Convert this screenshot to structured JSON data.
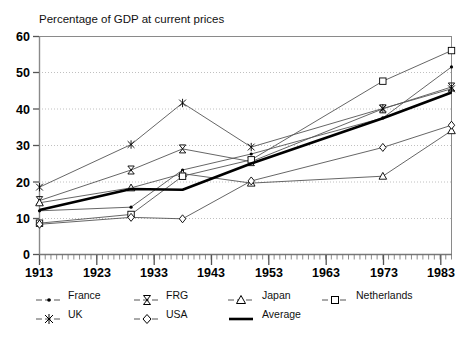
{
  "chart_data": {
    "type": "line",
    "title": "Percentage of GDP at current prices",
    "xlabel": "",
    "ylabel": "",
    "xlim": [
      1913,
      1985
    ],
    "ylim": [
      0,
      60
    ],
    "yticks": [
      0,
      10,
      20,
      30,
      40,
      50,
      60
    ],
    "xticks": [
      1913,
      1923,
      1933,
      1943,
      1953,
      1963,
      1973,
      1983
    ],
    "xtick_labels": [
      "1913",
      "1923",
      "1933",
      "1943",
      "1953",
      "1963",
      "1973",
      "1983"
    ],
    "ytick_labels": [
      "0",
      "10",
      "20",
      "30",
      "40",
      "50",
      "60"
    ],
    "minor_x_ticks": "every year",
    "grid": "horizontal dotted gridlines at y = 10, 20, 30, 40, 50",
    "legend_position": "below axes, two rows of four",
    "x": [
      1913,
      1929,
      1938,
      1950,
      1973,
      1985
    ],
    "series": [
      {
        "name": "France",
        "marker": "dot",
        "values": [
          12.0,
          13.0,
          23.2,
          27.6,
          37.5,
          51.5
        ]
      },
      {
        "name": "FRG",
        "marker": "bowtie",
        "values": [
          14.8,
          23.2,
          29.0,
          25.5,
          40.0,
          46.0
        ]
      },
      {
        "name": "Japan",
        "marker": "triangle",
        "values": [
          14.2,
          18.3,
          22.2,
          19.6,
          21.5,
          34.0
        ]
      },
      {
        "name": "Netherlands",
        "marker": "square",
        "values": [
          8.6,
          11.0,
          21.5,
          26.0,
          47.6,
          56.0
        ]
      },
      {
        "name": "UK",
        "marker": "cross",
        "values": [
          18.5,
          30.2,
          41.6,
          29.5,
          40.1,
          45.5
        ]
      },
      {
        "name": "USA",
        "marker": "diamond",
        "values": [
          8.3,
          10.2,
          9.8,
          20.2,
          29.4,
          35.5
        ]
      },
      {
        "name": "Average",
        "marker": "none",
        "values": [
          12.2,
          18.0,
          17.8,
          25.0,
          37.4,
          44.5
        ]
      }
    ]
  },
  "legend": {
    "entries": [
      {
        "label": "France",
        "marker": "dot"
      },
      {
        "label": "FRG",
        "marker": "bowtie"
      },
      {
        "label": "Japan",
        "marker": "triangle"
      },
      {
        "label": "Netherlands",
        "marker": "square"
      },
      {
        "label": "UK",
        "marker": "cross"
      },
      {
        "label": "USA",
        "marker": "diamond"
      },
      {
        "label": "Average",
        "marker": "thick-line"
      }
    ]
  },
  "colors": {
    "line": "#555555",
    "average": "#000000",
    "axis": "#6a6a6a",
    "grid": "#bbbbbb",
    "text": "#111111",
    "background": "#ffffff"
  }
}
